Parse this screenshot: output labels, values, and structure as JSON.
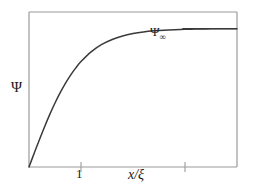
{
  "figure": {
    "title": "",
    "background_color": "#ffffff",
    "line_color": "#3a3a3a",
    "frame_color": "#9a9a9a",
    "text_color": "#1a1a1a"
  },
  "labels": {
    "y_axis": "Ψ",
    "x_axis": "x/ξ",
    "asymptote_base": "Ψ",
    "asymptote_subscript": "∞",
    "x_tick_1": "1"
  },
  "chart_data": {
    "type": "line",
    "title": "",
    "xlabel": "x/ξ",
    "ylabel": "Ψ",
    "grid": false,
    "legend": false,
    "xlim": [
      0,
      4
    ],
    "ylim": [
      0,
      1.12
    ],
    "xticks": [
      1,
      3
    ],
    "xticklabels": [
      "1",
      ""
    ],
    "yticks": [],
    "yticklabels": [],
    "annotations": [
      {
        "text": "Ψ∞",
        "x": 2.55,
        "y": 1.0,
        "note": "horizontal asymptote label"
      }
    ],
    "series": [
      {
        "name": "Ψ(x/ξ)",
        "kind": "curve",
        "formula": "tanh(x/ξ)",
        "x": [
          0,
          0.1,
          0.2,
          0.3,
          0.4,
          0.5,
          0.6,
          0.7,
          0.8,
          0.9,
          1.0,
          1.2,
          1.4,
          1.6,
          1.8,
          2.0,
          2.2,
          2.4,
          2.6,
          2.8,
          3.0,
          3.2,
          3.4,
          3.6,
          3.8,
          4.0
        ],
        "values": [
          0.0,
          0.0997,
          0.1974,
          0.2913,
          0.3799,
          0.4621,
          0.537,
          0.6044,
          0.664,
          0.7163,
          0.7616,
          0.8337,
          0.8854,
          0.9217,
          0.9468,
          0.964,
          0.9757,
          0.9837,
          0.989,
          0.9926,
          0.9951,
          0.9967,
          0.9978,
          0.9985,
          0.999,
          0.9993
        ]
      },
      {
        "name": "asymptote",
        "kind": "horizontal-line",
        "y": 1.0,
        "x_start": 2.95,
        "x_end": 4.0
      }
    ]
  }
}
